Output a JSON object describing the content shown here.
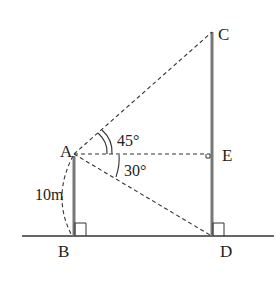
{
  "diagram": {
    "points": {
      "A": {
        "label": "A",
        "x": 74,
        "y": 154
      },
      "B": {
        "label": "B",
        "x": 74,
        "y": 236
      },
      "C": {
        "label": "C",
        "x": 212,
        "y": 32
      },
      "D": {
        "label": "D",
        "x": 212,
        "y": 236
      },
      "E": {
        "label": "E",
        "x": 212,
        "y": 154
      }
    },
    "angles": {
      "elevation": "45°",
      "depression": "30°"
    },
    "lengths": {
      "AB": "10m"
    },
    "colors": {
      "pole": "#777777",
      "line": "#333333"
    }
  }
}
